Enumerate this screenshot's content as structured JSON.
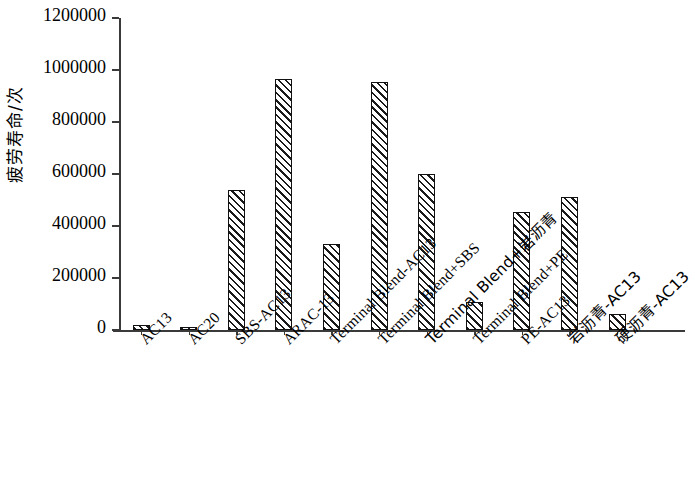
{
  "chart_data": {
    "type": "bar",
    "title": "",
    "xlabel": "",
    "ylabel": "疲劳寿命/次",
    "ylim": [
      0,
      1200000
    ],
    "ytick_step": 200000,
    "yticks": [
      "0",
      "200000",
      "400000",
      "600000",
      "800000",
      "1000000",
      "1200000"
    ],
    "grid": false,
    "legend": "none",
    "categories": [
      "AC13",
      "AC20",
      "SBS-AC13",
      "ARAC-13",
      "Terminal Blend-AC13",
      "Terminal Blend+SBS",
      "Terminal Blend+岩沥青",
      "Terminal Blend+PE",
      "PE-AC13",
      "岩沥青-AC13",
      "硬沥青-AC13"
    ],
    "values": [
      18000,
      13000,
      540000,
      965000,
      330000,
      952000,
      600000,
      108000,
      455000,
      512000,
      62000
    ]
  },
  "style": {
    "bar_fill": "#ffffff",
    "bar_edge": "#111111",
    "hatch": "diagonal-forward",
    "axis_color": "#3a3a3a",
    "background": "#ffffff"
  }
}
